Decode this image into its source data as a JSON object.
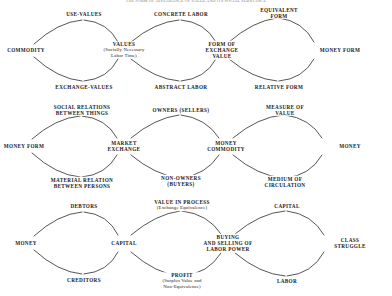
{
  "title": "THE FORM OF APPEARANCE OF VALUE AND ITS SOCIAL SUBSTANCE",
  "diagram": {
    "type": "dialectical-derivation-chain",
    "rows": [
      {
        "id": "row-1",
        "clusters": [
          {
            "id": "cluster-commodity",
            "left": "COMMODITY",
            "top": "USE-VALUES",
            "bottom": "EXCHANGE-VALUES",
            "right": "VALUES",
            "right_sub": "(Socially Necessary\nLabor Time)"
          },
          {
            "id": "cluster-values",
            "left": "VALUES",
            "top": "CONCRETE LABOR",
            "bottom": "ABSTRACT LABOR",
            "right": "FORM OF\nEXCHANGE\nVALUE"
          },
          {
            "id": "cluster-form-of-exchange-value",
            "left": "FORM OF EXCHANGE VALUE",
            "top": "EQUIVALENT\nFORM",
            "bottom": "RELATIVE FORM",
            "right": "MONEY FORM"
          }
        ]
      },
      {
        "id": "row-2",
        "clusters": [
          {
            "id": "cluster-money-form",
            "left": "MONEY FORM",
            "top": "SOCIAL RELATIONS\nBETWEEN THINGS",
            "bottom": "MATERIAL RELATION\nBETWEEN PERSONS",
            "right": "MARKET\nEXCHANGE"
          },
          {
            "id": "cluster-market-exchange",
            "left": "MARKET EXCHANGE",
            "top": "OWNERS (SELLERS)",
            "bottom": "NON-OWNERS\n(BUYERS)",
            "right": "MONEY\nCOMMODITY"
          },
          {
            "id": "cluster-money-commodity",
            "left": "MONEY COMMODITY",
            "top": "MEASURE OF\nVALUE",
            "bottom": "MEDIUM OF\nCIRCULATION",
            "right": "MONEY"
          }
        ]
      },
      {
        "id": "row-3",
        "clusters": [
          {
            "id": "cluster-money",
            "left": "MONEY",
            "top": "DEBTORS",
            "bottom": "CREDITORS",
            "right": "CAPITAL"
          },
          {
            "id": "cluster-capital",
            "left": "CAPITAL",
            "top": "VALUE IN PROCESS",
            "top_sub": "(Exchange Equivalence)",
            "bottom": "PROFIT",
            "bottom_sub": "(Surplus Value and\nNon-Equivalence)",
            "right": "BUYING\nAND SELLING OF\nLABOR POWER"
          },
          {
            "id": "cluster-buying-selling-labor-power",
            "left": "BUYING AND SELLING OF LABOR POWER",
            "top": "CAPITAL",
            "bottom": "LABOR",
            "right": "CLASS\nSTRUGGLE"
          }
        ]
      }
    ],
    "nodes": {
      "r1_commodity": "COMMODITY",
      "r1_use_values": "USE-VALUES",
      "r1_exchange_values": "EXCHANGE-VALUES",
      "r1_values": "VALUES",
      "r1_values_sub1": "(Socially Necessary",
      "r1_values_sub2": "Labor Time)",
      "r1_concrete_labor": "CONCRETE LABOR",
      "r1_abstract_labor": "ABSTRACT LABOR",
      "r1_form1": "FORM OF",
      "r1_form2": "EXCHANGE",
      "r1_form3": "VALUE",
      "r1_equivalent1": "EQUIVALENT",
      "r1_equivalent2": "FORM",
      "r1_relative_form": "RELATIVE FORM",
      "r1_money_form": "MONEY FORM",
      "r2_money_form": "MONEY FORM",
      "r2_social1": "SOCIAL RELATIONS",
      "r2_social2": "BETWEEN THINGS",
      "r2_material1": "MATERIAL RELATION",
      "r2_material2": "BETWEEN PERSONS",
      "r2_market1": "MARKET",
      "r2_market2": "EXCHANGE",
      "r2_owners": "OWNERS (SELLERS)",
      "r2_nonowners1": "NON-OWNERS",
      "r2_nonowners2": "(BUYERS)",
      "r2_moneycom1": "MONEY",
      "r2_moneycom2": "COMMODITY",
      "r2_measure1": "MEASURE OF",
      "r2_measure2": "VALUE",
      "r2_medium1": "MEDIUM OF",
      "r2_medium2": "CIRCULATION",
      "r2_money": "MONEY",
      "r3_money": "MONEY",
      "r3_debtors": "DEBTORS",
      "r3_creditors": "CREDITORS",
      "r3_capital": "CAPITAL",
      "r3_vip1": "VALUE IN PROCESS",
      "r3_vip2": "(Exchange Equivalence)",
      "r3_profit1": "PROFIT",
      "r3_profit2": "(Surplus Value and",
      "r3_profit3": "Non-Equivalence)",
      "r3_buying1": "BUYING",
      "r3_buying2": "AND SELLING OF",
      "r3_buying3": "LABOR POWER",
      "r3_capital_top": "CAPITAL",
      "r3_labor": "LABOR",
      "r3_class1": "CLASS",
      "r3_class2": "STRUGGLE"
    }
  },
  "colors": {
    "background": "#ffffff",
    "text": "#1a1a1a",
    "arc": "#2b2b2b",
    "title": "#7a7a7a"
  }
}
